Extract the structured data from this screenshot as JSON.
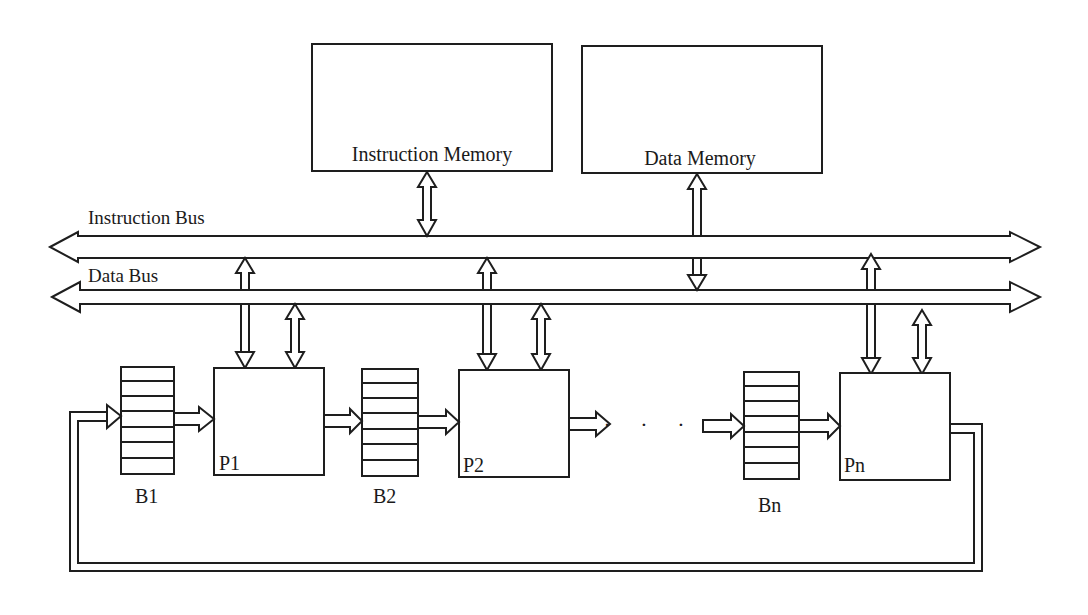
{
  "diagram": {
    "memories": {
      "instruction": {
        "label": "Instruction Memory"
      },
      "data": {
        "label": "Data Memory"
      }
    },
    "buses": {
      "instruction": {
        "label": "Instruction Bus"
      },
      "data": {
        "label": "Data Bus"
      }
    },
    "buffers": [
      {
        "label": "B1"
      },
      {
        "label": "B2"
      },
      {
        "label": "Bn"
      }
    ],
    "processors": [
      {
        "label": "P1"
      },
      {
        "label": "P2"
      },
      {
        "label": "Pn"
      }
    ],
    "ellipsis": "· · ·",
    "colors": {
      "line": "#1e1e1e",
      "background": "#ffffff"
    }
  }
}
